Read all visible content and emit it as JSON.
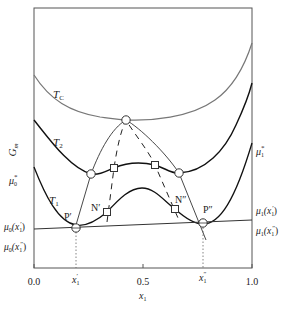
{
  "diagram": {
    "type": "free-energy composition diagram (spinodal / binodal)",
    "y_axis_label": "G",
    "y_axis_label_sub": "m",
    "x_axis_label": "x",
    "x_axis_label_sub": "1",
    "x_ticks": [
      "0.0",
      "0.5",
      "1.0"
    ],
    "x_marks": [
      {
        "base": "x",
        "sub": "1",
        "sup": "′",
        "id": "x1-prime"
      },
      {
        "base": "x",
        "sub": "1",
        "sup": "″",
        "id": "x1-doubleprime"
      }
    ],
    "curves": [
      {
        "name": "T",
        "sub": "C",
        "id": "Tc"
      },
      {
        "name": "T",
        "sub": "2",
        "id": "T2"
      },
      {
        "name": "T",
        "sub": "1",
        "id": "T1"
      }
    ],
    "left_labels": [
      {
        "base": "μ",
        "sub": "0",
        "sup": "*",
        "id": "mu0-star"
      },
      {
        "base": "μ",
        "sub": "0",
        "arg": "(x",
        "argsub": "1",
        "argsup": "′",
        "close": ")",
        "id": "mu0-x1p"
      },
      {
        "base": "μ",
        "sub": "0",
        "arg": "(x",
        "argsub": "1",
        "argsup": "″",
        "close": ")",
        "id": "mu0-x1pp"
      }
    ],
    "right_labels": [
      {
        "base": "μ",
        "sub": "1",
        "sup": "*",
        "id": "mu1-star"
      },
      {
        "base": "μ",
        "sub": "1",
        "arg": "(x",
        "argsub": "1",
        "argsup": "′",
        "close": ")",
        "id": "mu1-x1p"
      },
      {
        "base": "μ",
        "sub": "1",
        "arg": "(x",
        "argsub": "1",
        "argsup": "″",
        "close": ")",
        "id": "mu1-x1pp"
      }
    ],
    "points": [
      {
        "label": "P′",
        "id": "P-prime"
      },
      {
        "label": "P″",
        "id": "P-doubleprime"
      },
      {
        "label": "N′",
        "id": "N-prime"
      },
      {
        "label": "N″",
        "id": "N-doubleprime"
      }
    ],
    "legend_markers": {
      "circle": "binodal (common tangent) point",
      "square": "spinodal (inflection) point"
    }
  }
}
